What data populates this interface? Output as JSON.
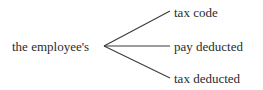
{
  "diagram": {
    "type": "bracket-branching-diagram",
    "stem": {
      "label": "the employee's"
    },
    "branches": [
      {
        "label": "tax code"
      },
      {
        "label": "pay deducted"
      },
      {
        "label": "tax deducted"
      }
    ],
    "style": {
      "background_color": "#ffffff",
      "text_color": "#2b2b2b",
      "line_color": "#3a3a3a"
    },
    "geometry": {
      "vertex_x": 104,
      "vertex_y": 46,
      "branch_end_x": 170,
      "branch_end_y": [
        11,
        46,
        78
      ]
    }
  }
}
